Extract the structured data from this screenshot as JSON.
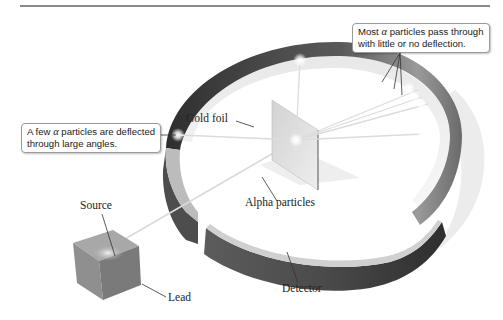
{
  "figure": {
    "callouts": {
      "most": {
        "line1_pre": "Most ",
        "alpha": "α",
        "line1_post": " particles pass through",
        "line2": "with little or no deflection."
      },
      "few": {
        "line1_pre": "A few ",
        "alpha": "α",
        "line1_post": " particles are deflected",
        "line2": "through large angles."
      }
    },
    "labels": {
      "gold_foil": "Gold foil",
      "alpha_particles": "Alpha particles",
      "source": "Source",
      "lead": "Lead",
      "detector": "Detector"
    },
    "colors": {
      "detector_dark": "#3a3a3a",
      "detector_mid": "#6e6e6e",
      "detector_light": "#b5b5b5",
      "lead_block": "#8c8c8c",
      "rule": "#8a8a8a",
      "ray": "#d8d8d8",
      "callout_border": "#9a9a9a"
    }
  }
}
